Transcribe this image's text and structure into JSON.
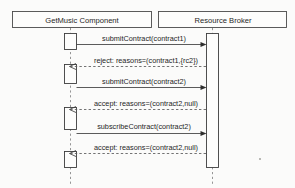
{
  "diagram": {
    "type": "uml-sequence-diagram",
    "background_color": "#fbfbfa",
    "stroke_color": "#3d3d3d",
    "lifelines": [
      {
        "id": "getmusic",
        "label": "GetMusic Component",
        "box": {
          "x": 12,
          "y": 11,
          "width": 140,
          "height": 17
        },
        "axis_x": 70
      },
      {
        "id": "broker",
        "label": "Resource Broker",
        "box": {
          "x": 158,
          "y": 11,
          "width": 129,
          "height": 17
        },
        "axis_x": 212
      }
    ],
    "activations": [
      {
        "lifeline": "getmusic",
        "x": 64,
        "y": 33,
        "width": 13,
        "height": 17
      },
      {
        "lifeline": "getmusic",
        "x": 64,
        "y": 64,
        "width": 13,
        "height": 20
      },
      {
        "lifeline": "getmusic",
        "x": 64,
        "y": 107,
        "width": 13,
        "height": 23
      },
      {
        "lifeline": "getmusic",
        "x": 64,
        "y": 151,
        "width": 13,
        "height": 17
      },
      {
        "lifeline": "broker",
        "x": 206,
        "y": 33,
        "width": 13,
        "height": 135
      }
    ],
    "messages": [
      {
        "index": 1,
        "label": "submitContract(contract1)",
        "kind": "call",
        "direction": "right",
        "from": "getmusic",
        "to": "broker",
        "y": 44,
        "label_y": 40
      },
      {
        "index": 2,
        "label": "reject: reasons=(contract1,{rc2})",
        "kind": "return",
        "direction": "left",
        "from": "broker",
        "to": "getmusic",
        "y": 66,
        "label_y": 62
      },
      {
        "index": 3,
        "label": "submitContract(contract2)",
        "kind": "call",
        "direction": "right",
        "from": "getmusic",
        "to": "broker",
        "y": 87,
        "label_y": 83
      },
      {
        "index": 4,
        "label": "accept: reasons=(contract2,null)",
        "kind": "return",
        "direction": "left",
        "from": "broker",
        "to": "getmusic",
        "y": 109,
        "label_y": 105
      },
      {
        "index": 5,
        "label": "subscribeContract(contract2)",
        "kind": "call",
        "direction": "right",
        "from": "getmusic",
        "to": "broker",
        "y": 133,
        "label_y": 128
      },
      {
        "index": 6,
        "label": "accept: reasons=(contract2,null)",
        "kind": "return",
        "direction": "left",
        "from": "broker",
        "to": "getmusic",
        "y": 153,
        "label_y": 149
      }
    ]
  }
}
